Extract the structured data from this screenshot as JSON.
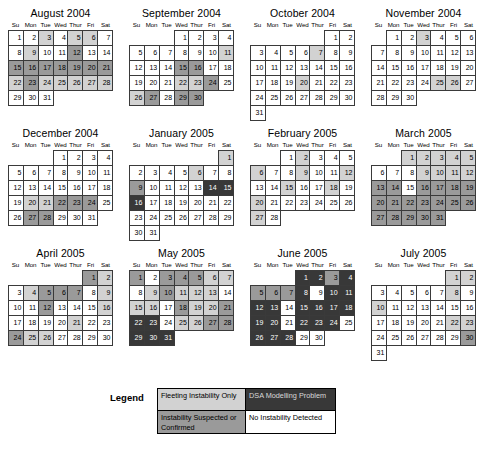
{
  "weekday_headers": [
    "Su",
    "Mon",
    "Tue",
    "Wed",
    "Thur",
    "Fri",
    "Sat"
  ],
  "legend": {
    "label": "Legend",
    "items": [
      {
        "text": "Fleeting Instability Only",
        "shade": "s1",
        "color": "#d2d2d2"
      },
      {
        "text": "DSA Modelling Problem",
        "shade": "s3",
        "color": "#383838"
      },
      {
        "text": "Instability Suspected or Confirmed",
        "shade": "s2",
        "color": "#9a9a9a"
      },
      {
        "text": "No Instability Detected",
        "shade": "s0",
        "color": "#ffffff"
      }
    ]
  },
  "shading_key": {
    "s0": "No Instability Detected",
    "s1": "Fleeting Instability Only",
    "s2": "Instability Suspected or Confirmed",
    "s3": "DSA Modelling Problem"
  },
  "months": [
    {
      "title": "August 2004",
      "start_dow": 0,
      "days": 31,
      "shades": {
        "3": "s1",
        "5": "s1",
        "6": "s1",
        "9": "s1",
        "12": "s2",
        "15": "s2",
        "16": "s2",
        "17": "s2",
        "18": "s2",
        "19": "s2",
        "20": "s2",
        "21": "s2",
        "22": "s1",
        "23": "s2",
        "24": "s1",
        "25": "s1",
        "26": "s1",
        "27": "s1",
        "28": "s1"
      }
    },
    {
      "title": "September 2004",
      "start_dow": 3,
      "days": 30,
      "shades": {
        "11": "s1",
        "15": "s2",
        "16": "s2",
        "22": "s1",
        "23": "s1",
        "24": "s2",
        "26": "s1",
        "27": "s2",
        "29": "s2",
        "30": "s2"
      }
    },
    {
      "title": "October 2004",
      "start_dow": 5,
      "days": 31,
      "shades": {
        "7": "s1",
        "20": "s1"
      }
    },
    {
      "title": "November 2004",
      "start_dow": 1,
      "days": 30,
      "shades": {
        "3": "s1",
        "25": "s1",
        "26": "s1"
      }
    },
    {
      "title": "December 2004",
      "start_dow": 3,
      "days": 31,
      "shades": {
        "20": "s1",
        "21": "s1",
        "22": "s2",
        "23": "s2",
        "24": "s2",
        "27": "s2",
        "28": "s2"
      }
    },
    {
      "title": "January 2005",
      "start_dow": 6,
      "days": 31,
      "shades": {
        "1": "s1",
        "6": "s1",
        "9": "s2",
        "14": "s3",
        "15": "s3",
        "16": "s3"
      }
    },
    {
      "title": "February 2005",
      "start_dow": 2,
      "days": 28,
      "shades": {
        "2": "s1",
        "6": "s1",
        "9": "s1",
        "12": "s1",
        "15": "s1",
        "18": "s1",
        "20": "s1",
        "27": "s1"
      }
    },
    {
      "title": "March 2005",
      "start_dow": 2,
      "days": 31,
      "shades": {
        "1": "s1",
        "2": "s1",
        "3": "s1",
        "4": "s1",
        "5": "s1",
        "9": "s1",
        "10": "s1",
        "11": "s1",
        "12": "s1",
        "13": "s2",
        "14": "s2",
        "16": "s2",
        "17": "s2",
        "18": "s2",
        "19": "s2",
        "20": "s2",
        "21": "s2",
        "22": "s2",
        "23": "s2",
        "24": "s2",
        "25": "s2",
        "26": "s2",
        "27": "s2",
        "28": "s2",
        "29": "s2",
        "30": "s2",
        "31": "s2"
      }
    },
    {
      "title": "April 2005",
      "start_dow": 5,
      "days": 30,
      "shades": {
        "1": "s2",
        "2": "s1",
        "4": "s1",
        "5": "s2",
        "6": "s2",
        "7": "s2",
        "9": "s1",
        "12": "s2",
        "16": "s1",
        "21": "s1",
        "24": "s2",
        "25": "s1",
        "26": "s1"
      }
    },
    {
      "title": "May 2005",
      "start_dow": 0,
      "days": 31,
      "shades": {
        "1": "s2",
        "3": "s2",
        "4": "s2",
        "5": "s2",
        "6": "s1",
        "7": "s1",
        "9": "s1",
        "10": "s2",
        "11": "s1",
        "12": "s1",
        "13": "s1",
        "15": "s1",
        "16": "s1",
        "18": "s2",
        "19": "s1",
        "20": "s1",
        "21": "s2",
        "22": "s3",
        "23": "s3",
        "25": "s1",
        "26": "s1",
        "27": "s2",
        "28": "s2",
        "29": "s3",
        "30": "s3",
        "31": "s3"
      }
    },
    {
      "title": "June 2005",
      "start_dow": 3,
      "days": 30,
      "shades": {
        "1": "s3",
        "2": "s3",
        "3": "s2",
        "4": "s3",
        "5": "s2",
        "6": "s2",
        "7": "s2",
        "8": "s3",
        "10": "s3",
        "11": "s3",
        "12": "s3",
        "13": "s3",
        "15": "s3",
        "16": "s3",
        "17": "s3",
        "18": "s3",
        "19": "s3",
        "20": "s3",
        "22": "s3",
        "23": "s3",
        "24": "s3",
        "26": "s3",
        "27": "s3",
        "28": "s3"
      }
    },
    {
      "title": "July 2005",
      "start_dow": 5,
      "days": 31,
      "shades": {
        "1": "s1",
        "2": "s1",
        "8": "s1",
        "10": "s1",
        "22": "s1",
        "23": "s1",
        "30": "s2"
      }
    }
  ]
}
